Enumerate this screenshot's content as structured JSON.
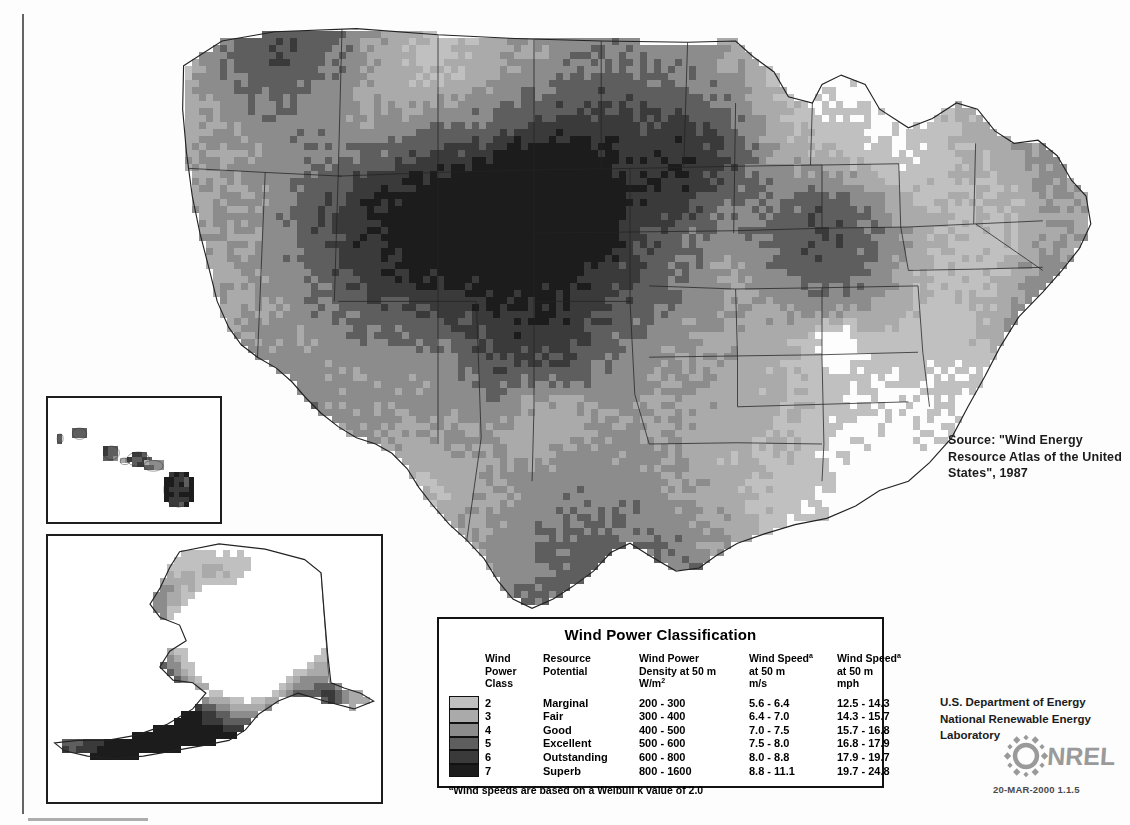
{
  "document": {
    "kind": "wind-resource-map",
    "region": "United States",
    "datestamp": "20-MAR-2000 1.1.5"
  },
  "source_note": "Source:  \"Wind Energy Resource Atlas of the United States\", 1987",
  "agency": {
    "line1": "U.S. Department of Energy",
    "line2": "National Renewable Energy Laboratory",
    "logo_text": "NREL",
    "logo_icon": "nrel-sunburst-icon"
  },
  "legend": {
    "title": "Wind Power Classification",
    "columns": [
      "Wind\nPower\nClass",
      "Resource\nPotential",
      "Wind Power\nDensity at 50 m\nW/m",
      "Wind Speed\nat 50 m\nm/s",
      "Wind Speed\nat 50 m\nmph"
    ],
    "col_sup": [
      "",
      "",
      "2",
      "a",
      "a"
    ],
    "rows": [
      {
        "class": "2",
        "potential": "Marginal",
        "density": "200 - 300",
        "ms": "5.6 -  6.4",
        "mph": "12.5 - 14.3",
        "color": "#c0c0c0"
      },
      {
        "class": "3",
        "potential": "Fair",
        "density": "300 - 400",
        "ms": "6.4 -  7.0",
        "mph": "14.3 - 15.7",
        "color": "#aaaaaa"
      },
      {
        "class": "4",
        "potential": "Good",
        "density": "400 - 500",
        "ms": "7.0 -  7.5",
        "mph": "15.7 - 16.8",
        "color": "#8c8c8c"
      },
      {
        "class": "5",
        "potential": "Excellent",
        "density": "500 - 600",
        "ms": "7.5 -  8.0",
        "mph": "16.8 - 17.9",
        "color": "#5e5e5e"
      },
      {
        "class": "6",
        "potential": "Outstanding",
        "density": "600 - 800",
        "ms": "8.0 -  8.8",
        "mph": "17.9 - 19.7",
        "color": "#3a3a3a"
      },
      {
        "class": "7",
        "potential": "Superb",
        "density": "800 - 1600",
        "ms": "8.8 - 11.1",
        "mph": "19.7 - 24.8",
        "color": "#1c1c1c"
      }
    ],
    "footnote": "Wind speeds are based on a Weibull k value of 2.0",
    "footnote_marker": "a"
  },
  "insets": [
    {
      "name": "hawaii-inset",
      "label": "Hawaii"
    },
    {
      "name": "alaska-inset",
      "label": "Alaska"
    }
  ],
  "chart_data": {
    "type": "heatmap",
    "title": "Wind Power Classification",
    "legend_position": "bottom-center",
    "class_values": [
      2,
      3,
      4,
      5,
      6,
      7
    ],
    "class_colors": [
      "#c0c0c0",
      "#aaaaaa",
      "#8c8c8c",
      "#5e5e5e",
      "#3a3a3a",
      "#1c1c1c"
    ],
    "background_color": "#ffffff",
    "cell_size_px": 7,
    "regions": [
      {
        "name": "pacific-northwest-coast",
        "cls": 4,
        "x": 8,
        "y": 2,
        "w": 10,
        "h": 14
      },
      {
        "name": "cascades-high",
        "cls": 6,
        "x": 14,
        "y": 1,
        "w": 10,
        "h": 9
      },
      {
        "name": "columbia-basin",
        "cls": 3,
        "x": 18,
        "y": 6,
        "w": 16,
        "h": 10
      },
      {
        "name": "idaho-mountains",
        "cls": 5,
        "x": 32,
        "y": 3,
        "w": 14,
        "h": 14
      },
      {
        "name": "montana-plains",
        "cls": 3,
        "x": 40,
        "y": 2,
        "w": 22,
        "h": 12
      },
      {
        "name": "wyoming-high",
        "cls": 6,
        "x": 40,
        "y": 12,
        "w": 14,
        "h": 12
      },
      {
        "name": "great-basin",
        "cls": 3,
        "x": 16,
        "y": 16,
        "w": 20,
        "h": 18
      },
      {
        "name": "sierra-nevada",
        "cls": 5,
        "x": 12,
        "y": 18,
        "w": 8,
        "h": 12
      },
      {
        "name": "california-coast",
        "cls": 4,
        "x": 6,
        "y": 22,
        "w": 7,
        "h": 14
      },
      {
        "name": "colorado-rockies",
        "cls": 5,
        "x": 38,
        "y": 22,
        "w": 12,
        "h": 12
      },
      {
        "name": "southwest-desert",
        "cls": 2,
        "x": 18,
        "y": 34,
        "w": 22,
        "h": 14
      },
      {
        "name": "dakotas",
        "cls": 4,
        "x": 56,
        "y": 4,
        "w": 18,
        "h": 14
      },
      {
        "name": "nebraska-kansas",
        "cls": 4,
        "x": 52,
        "y": 16,
        "w": 20,
        "h": 14
      },
      {
        "name": "oklahoma-texas-panhandle",
        "cls": 4,
        "x": 50,
        "y": 28,
        "w": 16,
        "h": 14
      },
      {
        "name": "texas-gulf-coast",
        "cls": 3,
        "x": 48,
        "y": 44,
        "w": 14,
        "h": 10
      },
      {
        "name": "upper-midwest",
        "cls": 3,
        "x": 70,
        "y": 6,
        "w": 18,
        "h": 16
      },
      {
        "name": "great-lakes-shore",
        "cls": 5,
        "x": 80,
        "y": 6,
        "w": 8,
        "h": 8
      },
      {
        "name": "ohio-valley",
        "cls": 2,
        "x": 80,
        "y": 22,
        "w": 18,
        "h": 14
      },
      {
        "name": "appalachian-ridges",
        "cls": 6,
        "x": 94,
        "y": 24,
        "w": 10,
        "h": 16
      },
      {
        "name": "northeast",
        "cls": 3,
        "x": 100,
        "y": 10,
        "w": 16,
        "h": 14
      },
      {
        "name": "atlantic-coast",
        "cls": 5,
        "x": 108,
        "y": 14,
        "w": 8,
        "h": 14
      },
      {
        "name": "southeast-interior",
        "cls": 1,
        "x": 84,
        "y": 38,
        "w": 24,
        "h": 16
      }
    ]
  }
}
